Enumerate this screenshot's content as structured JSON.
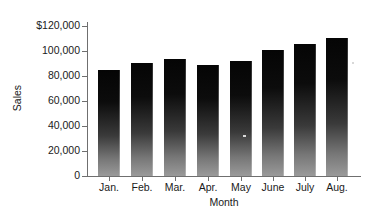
{
  "chart_data": {
    "type": "bar",
    "title": "",
    "xlabel": "Month",
    "ylabel": "Sales",
    "categories": [
      "Jan.",
      "Feb.",
      "Mar.",
      "Apr.",
      "May",
      "June",
      "July",
      "Aug."
    ],
    "values": [
      85000,
      90000,
      93500,
      89000,
      92000,
      101000,
      105500,
      110000
    ],
    "ylim": [
      0,
      120000
    ],
    "ytick_values": [
      0,
      20000,
      40000,
      60000,
      80000,
      100000,
      120000
    ],
    "ytick_labels": [
      "0",
      "20,000",
      "40,000",
      "60,000",
      "80,000",
      "100,000",
      "$120,000"
    ],
    "grid": false,
    "legend": null,
    "bar_color_top": "#050505",
    "bar_color_bottom": "#9a9a9a",
    "axis_color": "#6f6f6f",
    "text_color": "#1a1a1a",
    "background": "#ffffff"
  }
}
